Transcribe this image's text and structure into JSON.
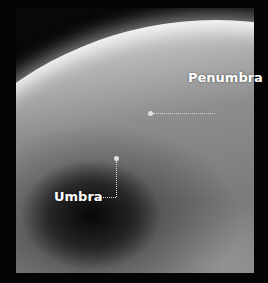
{
  "image": {
    "description": "Photograph of Earth from space showing the Moon's shadow during a solar eclipse",
    "labels": {
      "penumbra": "Penumbra",
      "umbra": "Umbra"
    }
  }
}
